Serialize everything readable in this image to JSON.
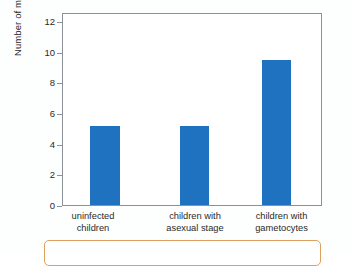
{
  "chart_data": {
    "type": "bar",
    "title": "",
    "xlabel": "",
    "ylabel": "Number of mosquitoes",
    "categories": [
      "uninfected\nchildren",
      "children with\nasexual stage",
      "children with\ngametocytes"
    ],
    "values": [
      5.4,
      5.35,
      9.9
    ],
    "ylim": [
      0,
      13
    ],
    "yticks": [
      0,
      2,
      4,
      6,
      8,
      10,
      12
    ],
    "ytick_labels": [
      "0",
      "2",
      "4",
      "6",
      "8",
      "10",
      "12"
    ],
    "grid": false,
    "legend": null,
    "bar_color": "#1f72bf",
    "axis_color": "#8b9196",
    "text_color": "#2a2a2a",
    "caption_box_color": "#dca15c"
  },
  "axes": {
    "y_title": "Number of mosquitoes"
  }
}
